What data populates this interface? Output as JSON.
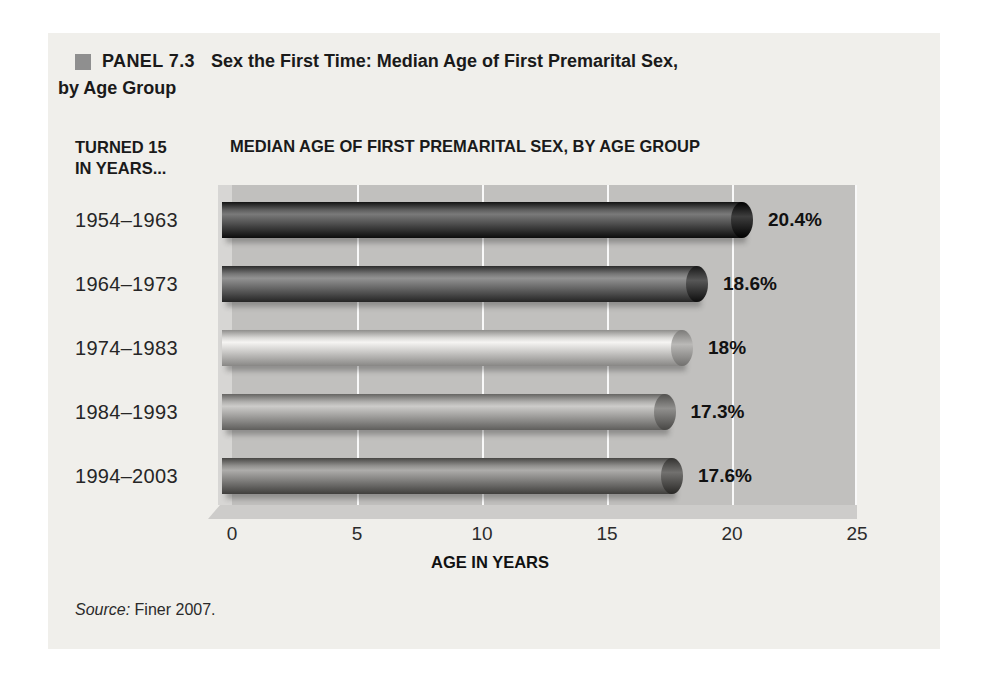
{
  "panel": {
    "label": "PANEL 7.3",
    "title_line1": "Sex the First Time: Median Age of First Premarital Sex,",
    "title_line2": "by Age Group"
  },
  "chart_header": {
    "left_line1": "TURNED 15",
    "left_line2": "IN YEARS...",
    "title": "MEDIAN AGE OF FIRST PREMARITAL SEX, BY AGE GROUP"
  },
  "source": {
    "prefix": "Source:",
    "text": " Finer 2007."
  },
  "colors": {
    "page_bg": "#ffffff",
    "figure_bg": "#f0efeb",
    "plot_bg": "#c1c0be",
    "plot_wall": "#d7d6d4",
    "gridline": "#ffffff",
    "bullet": "#8f8f8f",
    "bar_colors": [
      "#4a4a4a",
      "#636363",
      "#c6c5c3",
      "#9d9c9a",
      "#7e7d7b"
    ]
  },
  "chart_data": {
    "type": "bar",
    "orientation": "horizontal",
    "title": "MEDIAN AGE OF FIRST PREMARITAL SEX, BY AGE GROUP",
    "categories": [
      "1954–1963",
      "1964–1973",
      "1974–1983",
      "1984–1993",
      "1994–2003"
    ],
    "values": [
      20.4,
      18.6,
      18,
      17.3,
      17.6
    ],
    "value_labels": [
      "20.4%",
      "18.6%",
      "18%",
      "17.3%",
      "17.6%"
    ],
    "xlabel": "AGE IN YEARS",
    "xticks": [
      0,
      5,
      10,
      15,
      20,
      25
    ],
    "xlim": [
      0,
      25
    ],
    "grid": "vertical white gridlines at each tick",
    "legend": "none",
    "bar_style": "3D cylinder, grayscale, rounded right end cap"
  }
}
